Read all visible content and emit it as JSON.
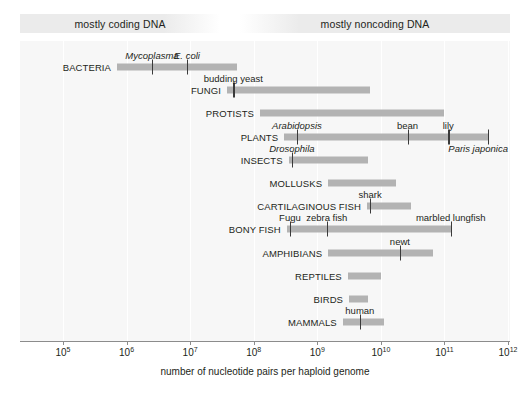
{
  "header": {
    "left_band": "mostly coding DNA",
    "right_band": "mostly noncoding DNA"
  },
  "axis": {
    "title": "number of nucleotide pairs per haploid genome",
    "ticks": [
      "10⁵",
      "10⁶",
      "10⁷",
      "10⁸",
      "10⁹",
      "10¹⁰",
      "10¹¹",
      "10¹²"
    ],
    "tick_exponents": [
      5,
      6,
      7,
      8,
      9,
      10,
      11,
      12
    ],
    "min_exponent": 5,
    "max_exponent": 12
  },
  "colors": {
    "bar": "#b3b3b3",
    "panel": "#f7f7f7",
    "band": "#ebebeb",
    "gridline": "#ffffff",
    "text": "#231f20",
    "marker": "#3a3a3a"
  },
  "chart_data": {
    "type": "bar",
    "title": "",
    "xlabel": "number of nucleotide pairs per haploid genome",
    "ylabel": "",
    "xscale": "log",
    "xlim": [
      100000,
      1000000000000
    ],
    "grid": true,
    "legend": "none",
    "annotations": [
      "mostly coding DNA",
      "mostly noncoding DNA"
    ],
    "categories": [
      "BACTERIA",
      "FUNGI",
      "PROTISTS",
      "PLANTS",
      "INSECTS",
      "MOLLUSKS",
      "CARTILAGINOUS FISH",
      "BONY FISH",
      "AMPHIBIANS",
      "REPTILES",
      "BIRDS",
      "MAMMALS"
    ],
    "rows": [
      {
        "label": "BACTERIA",
        "start_exp": 5.85,
        "end_exp": 7.73,
        "markers": [
          {
            "name": "Mycoplasma",
            "exp": 6.4,
            "italic": true,
            "position": "above"
          },
          {
            "name": "E. coli",
            "exp": 6.95,
            "italic": true,
            "position": "above"
          }
        ]
      },
      {
        "label": "FUNGI",
        "start_exp": 7.58,
        "end_exp": 9.83,
        "markers": [
          {
            "name": "budding yeast",
            "exp": 7.68,
            "italic": false,
            "position": "above"
          }
        ]
      },
      {
        "label": "PROTISTS",
        "start_exp": 8.1,
        "end_exp": 11.0,
        "markers": []
      },
      {
        "label": "PLANTS",
        "start_exp": 8.48,
        "end_exp": 11.68,
        "markers": [
          {
            "name": "Arabidopsis",
            "exp": 8.68,
            "italic": true,
            "position": "above"
          },
          {
            "name": "bean",
            "exp": 10.42,
            "italic": false,
            "position": "above"
          },
          {
            "name": "lily",
            "exp": 11.06,
            "italic": false,
            "position": "above"
          },
          {
            "name": "Paris japonica",
            "exp": 11.68,
            "italic": true,
            "position": "below"
          }
        ]
      },
      {
        "label": "INSECTS",
        "start_exp": 8.55,
        "end_exp": 9.8,
        "markers": [
          {
            "name": "Drosophila",
            "exp": 8.6,
            "italic": true,
            "position": "above"
          }
        ]
      },
      {
        "label": "MOLLUSKS",
        "start_exp": 9.17,
        "end_exp": 10.24,
        "markers": []
      },
      {
        "label": "CARTILAGINOUS FISH",
        "start_exp": 9.78,
        "end_exp": 10.48,
        "markers": [
          {
            "name": "shark",
            "exp": 9.83,
            "italic": false,
            "position": "above"
          }
        ]
      },
      {
        "label": "BONY FISH",
        "start_exp": 8.52,
        "end_exp": 11.1,
        "markers": [
          {
            "name": "Fugu",
            "exp": 8.57,
            "italic": false,
            "position": "above"
          },
          {
            "name": "zebra fish",
            "exp": 9.15,
            "italic": false,
            "position": "above"
          },
          {
            "name": "marbled lungfish",
            "exp": 11.1,
            "italic": false,
            "position": "above"
          }
        ]
      },
      {
        "label": "AMPHIBIANS",
        "start_exp": 9.17,
        "end_exp": 10.82,
        "markers": [
          {
            "name": "newt",
            "exp": 10.3,
            "italic": false,
            "position": "above"
          }
        ]
      },
      {
        "label": "REPTILES",
        "start_exp": 9.48,
        "end_exp": 10.0,
        "markers": []
      },
      {
        "label": "BIRDS",
        "start_exp": 9.5,
        "end_exp": 9.8,
        "markers": []
      },
      {
        "label": "MAMMALS",
        "start_exp": 9.4,
        "end_exp": 10.05,
        "markers": [
          {
            "name": "human",
            "exp": 9.67,
            "italic": false,
            "position": "above"
          }
        ]
      }
    ]
  }
}
